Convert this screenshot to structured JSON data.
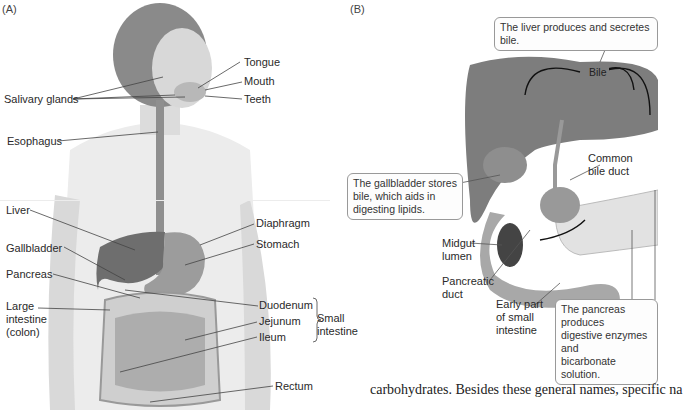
{
  "panelA": {
    "label": "(A)",
    "labels": {
      "tongue": "Tongue",
      "mouth": "Mouth",
      "teeth": "Teeth",
      "salivary": "Salivary glands",
      "esophagus": "Esophagus",
      "liver": "Liver",
      "gallbladder": "Gallbladder",
      "pancreas": "Pancreas",
      "large_intestine": "Large\nintestine\n(colon)",
      "diaphragm": "Diaphragm",
      "stomach": "Stomach",
      "duodenum": "Duodenum",
      "jejunum": "Jejunum",
      "ileum": "Ileum",
      "small_intestine": "Small\nintestine",
      "rectum": "Rectum"
    }
  },
  "panelB": {
    "label": "(B)",
    "callouts": {
      "liver": "The liver produces and secretes bile.",
      "gallbladder": "The gallbladder stores\nbile, which aids in\ndigesting lipids.",
      "pancreas": "The pancreas produces\ndigestive enzymes and\nbicarbonate solution."
    },
    "labels": {
      "bile": "Bile",
      "common_bile_duct": "Common\nbile duct",
      "midgut_lumen": "Midgut\nlumen",
      "pancreatic_duct": "Pancreatic\nduct",
      "early_small_intestine": "Early part\nof small\nintestine"
    }
  },
  "body_text": "carbohydrates. Besides these general names, specific na"
}
